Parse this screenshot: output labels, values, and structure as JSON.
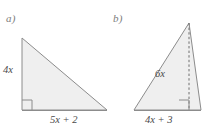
{
  "figure": {
    "title": "",
    "background_color": "#ffffff",
    "shape_fill_color": "#efefef",
    "shape_stroke_color": "#8c8c8c",
    "text_color": "#4a4a4a",
    "part_label_color": "#7d7d7d",
    "parts": [
      {
        "id": "a",
        "part_label": "a)",
        "shape": "right-triangle",
        "labels": {
          "height": "4x",
          "base": "5x + 2"
        },
        "right_angle_marker": true,
        "right_angle_position": "bottom-left",
        "vertices": [
          {
            "x": 22,
            "y": 38
          },
          {
            "x": 22,
            "y": 110
          },
          {
            "x": 107,
            "y": 110
          }
        ]
      },
      {
        "id": "b",
        "part_label": "b)",
        "shape": "triangle-with-altitude",
        "labels": {
          "height": "6x",
          "base": "4x + 3"
        },
        "right_angle_marker": true,
        "right_angle_position": "base-at-altitude-foot",
        "altitude_style": "dashed",
        "vertices": [
          {
            "x": 189,
            "y": 23
          },
          {
            "x": 134,
            "y": 110
          },
          {
            "x": 201,
            "y": 110
          }
        ],
        "altitude": {
          "from": {
            "x": 189,
            "y": 23
          },
          "to": {
            "x": 189,
            "y": 110
          }
        }
      }
    ]
  }
}
